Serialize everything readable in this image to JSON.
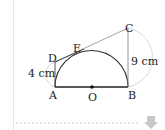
{
  "diagram": {
    "points": {
      "A": "A",
      "B": "B",
      "C": "C",
      "D": "D",
      "E": "E",
      "O": "O"
    },
    "measures": {
      "AD": "4 cm",
      "BC": "9 cm"
    },
    "colors": {
      "line": "#333333",
      "thin": "#9a9a9a",
      "arc": "#bdbdbd",
      "dashed": "#cfcfcf",
      "arrow": "#c8c8c8"
    }
  },
  "controls": {
    "scroll_down": "down-arrow"
  }
}
